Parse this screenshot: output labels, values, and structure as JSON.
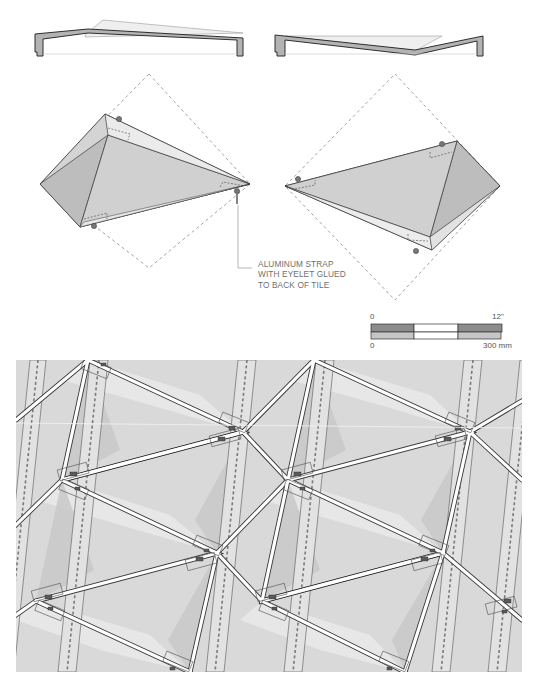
{
  "figure": {
    "type": "architectural-detail",
    "sections": [
      {
        "id": "section-left",
        "description": "tile section, peak toward left"
      },
      {
        "id": "section-right",
        "description": "tile section, valley toward right"
      }
    ],
    "tile_views": [
      {
        "id": "tile-left",
        "description": "pyramidal tile within dashed square bounding"
      },
      {
        "id": "tile-right",
        "description": "mirrored pyramidal tile within dashed square bounding"
      }
    ],
    "callout": {
      "lines": [
        "ALUMINUM STRAP",
        "WITH EYELET GLUED",
        "TO BACK OF TILE"
      ]
    },
    "scale_bar": {
      "imperial_start": "0",
      "imperial_end": "12\"",
      "metric_start": "0",
      "metric_end": "300 mm"
    },
    "plan": {
      "description": "tessellated tile pattern plan with straps and eyelets"
    },
    "colors": {
      "tile_light": "#e3e3e3",
      "tile_mid": "#d2d2d2",
      "tile_dark": "#bdbdbd",
      "outline": "#3a3a3a",
      "dashed": "#8a8a8a",
      "section_fill": "#b3b3b3",
      "scale_dark": "#8c8c8c",
      "scale_light": "#c6c6c6"
    }
  }
}
